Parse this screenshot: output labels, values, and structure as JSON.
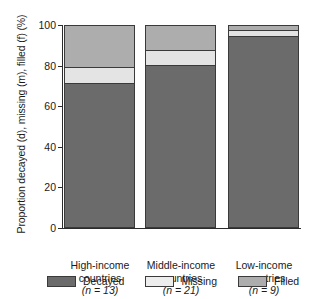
{
  "chart_data": {
    "type": "bar",
    "subtype": "stacked-percentage",
    "title": "",
    "xlabel": "",
    "ylabel": "Proportion decayed (d), missing (m), filled (f) (%)",
    "ylim": [
      0,
      100
    ],
    "yticks": [
      0,
      20,
      40,
      60,
      80,
      100
    ],
    "ytick_labels": [
      "0",
      "20",
      "40",
      "60",
      "80",
      "100"
    ],
    "grid": false,
    "legend_position": "bottom",
    "categories": [
      "High-income countries",
      "Middle-income countries",
      "Low-income countries"
    ],
    "category_lines": [
      {
        "line1": "High-income",
        "line2": "countries",
        "line3": "(n = 13)",
        "n": 13
      },
      {
        "line1": "Middle-income",
        "line2": "countries",
        "line3": "(n = 21)",
        "n": 21
      },
      {
        "line1": "Low-income",
        "line2": "countries",
        "line3": "(n = 9)",
        "n": 9
      }
    ],
    "series": [
      {
        "name": "Decayed",
        "color": "#6b6b6b",
        "values": [
          72,
          81,
          95
        ]
      },
      {
        "name": "Missing",
        "color": "#e4e4e4",
        "values": [
          8,
          7,
          3
        ]
      },
      {
        "name": "Filled",
        "color": "#adadad",
        "values": [
          20,
          12,
          2
        ]
      }
    ]
  },
  "axis": {
    "y_title": "Proportion decayed (d), missing (m), filled (f) (%)",
    "ticks": [
      "100",
      "80",
      "60",
      "40",
      "20",
      "0"
    ]
  },
  "legend": {
    "items": [
      {
        "label": "Decayed",
        "swatch": "decayed"
      },
      {
        "label": "Missing",
        "swatch": "missing"
      },
      {
        "label": "Filled",
        "swatch": "filled"
      }
    ]
  },
  "colors": {
    "decayed": "#6b6b6b",
    "missing": "#e4e4e4",
    "filled": "#adadad",
    "outline": "#3a3a3a",
    "text": "#1a1a1a",
    "background": "#ffffff"
  }
}
